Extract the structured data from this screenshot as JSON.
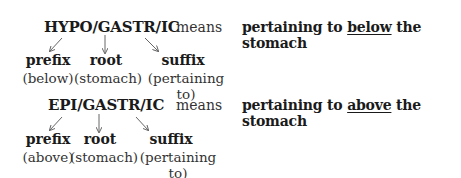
{
  "entries": [
    {
      "term": "HYPO/GASTR/IC",
      "means_label": "means",
      "definition_pre": "pertaining to ",
      "definition_emph": "below",
      "definition_post": " the stomach",
      "parts": [
        {
          "label": "prefix",
          "meaning": "(below)"
        },
        {
          "label": "root",
          "meaning": "(stomach)"
        },
        {
          "label": "suffix",
          "meaning": "(pertaining to)"
        }
      ]
    },
    {
      "term": "EPI/GASTR/IC",
      "means_label": "means",
      "definition_pre": "pertaining to ",
      "definition_emph": "above",
      "definition_post": " the stomach",
      "parts": [
        {
          "label": "prefix",
          "meaning": "(above)"
        },
        {
          "label": "root",
          "meaning": "(stomach)"
        },
        {
          "label": "suffix",
          "meaning": "(pertaining to)"
        }
      ]
    }
  ],
  "colors": {
    "text": "#1a1a1a",
    "arrow": "#666666"
  }
}
